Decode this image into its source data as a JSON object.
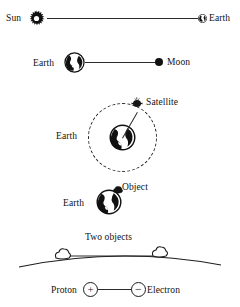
{
  "figure": {
    "panels": [
      {
        "id": "sun-earth",
        "left_label": "Sun",
        "right_label": "Earth",
        "left_icon": "sun-icon",
        "right_icon": "earth-globe-icon",
        "connector": "straight-line"
      },
      {
        "id": "earth-moon",
        "left_label": "Earth",
        "right_label": "Moon",
        "left_icon": "earth-globe-icon",
        "right_icon": "moon-dot-icon",
        "connector": "straight-line"
      },
      {
        "id": "earth-satellite",
        "left_label": "Earth",
        "right_label": "Satellite",
        "left_icon": "earth-globe-icon",
        "right_icon": "satellite-icon",
        "connector": "dashed-orbit-circle"
      },
      {
        "id": "earth-object",
        "left_label": "Earth",
        "right_label": "Object",
        "left_icon": "earth-globe-icon",
        "right_icon": "object-blob-icon",
        "connector": "contact"
      },
      {
        "id": "two-objects",
        "caption": "Two objects",
        "left_icon": "rock-object-icon",
        "right_icon": "rock-object-icon",
        "ground_icon": "ground-arc-icon",
        "connector": "straight-line"
      },
      {
        "id": "proton-electron",
        "left_label": "Proton",
        "right_label": "Electron",
        "left_icon": "plus-charge-icon",
        "right_icon": "minus-charge-icon",
        "left_sign": "+",
        "right_sign": "−",
        "connector": "straight-line"
      }
    ]
  },
  "colors": {
    "ink": "#111111",
    "line": "#2b2b2b",
    "background": "#ffffff"
  }
}
